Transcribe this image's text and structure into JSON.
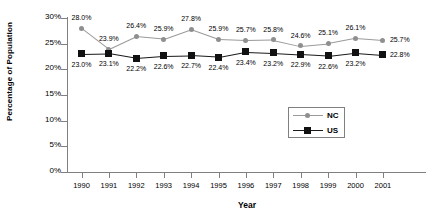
{
  "chart_data": {
    "type": "line",
    "title": "",
    "xlabel": "Year",
    "ylabel": "Percentage of Population",
    "categories": [
      "1990",
      "1991",
      "1992",
      "1993",
      "1994",
      "1995",
      "1996",
      "1997",
      "1998",
      "1999",
      "2000",
      "2001"
    ],
    "ylim": [
      0,
      30
    ],
    "ytick_values": [
      0,
      5,
      10,
      15,
      20,
      25,
      30
    ],
    "ytick_labels": [
      "0%",
      "5%",
      "10%",
      "15%",
      "20%",
      "25%",
      "30%"
    ],
    "grid": false,
    "legend_position": "inside-lower-right",
    "series": [
      {
        "name": "NC",
        "marker": "circle",
        "color": "#8f8f8f",
        "values": [
          28.0,
          23.9,
          26.4,
          25.9,
          27.8,
          25.9,
          25.7,
          25.8,
          24.6,
          25.1,
          26.1,
          25.7
        ],
        "labels": [
          "28.0%",
          "23.9%",
          "26.4%",
          "25.9%",
          "27.8%",
          "25.9%",
          "25.7%",
          "25.8%",
          "24.6%",
          "25.1%",
          "26.1%",
          "25.7%"
        ]
      },
      {
        "name": "US",
        "marker": "square",
        "color": "#111111",
        "values": [
          23.0,
          23.1,
          22.2,
          22.6,
          22.7,
          22.4,
          23.4,
          23.2,
          22.9,
          22.6,
          23.2,
          22.8
        ],
        "labels": [
          "23.0%",
          "23.1%",
          "22.2%",
          "22.6%",
          "22.7%",
          "22.4%",
          "23.4%",
          "23.2%",
          "22.9%",
          "22.6%",
          "23.2%",
          "22.8%"
        ]
      }
    ]
  },
  "legend": {
    "entries": [
      {
        "label": "NC"
      },
      {
        "label": "US"
      }
    ]
  }
}
